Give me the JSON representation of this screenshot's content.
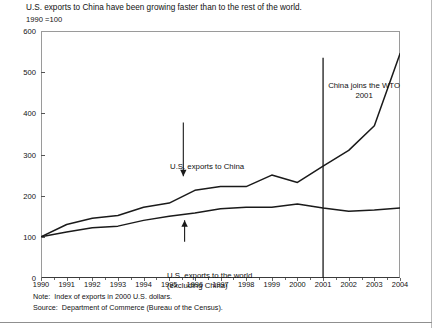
{
  "title": "U.S. exports to China have been growing faster than to the rest of the world.",
  "subtitle": "1990 =100",
  "notes": {
    "note_label": "Note:",
    "note_text": "Index of exports in 2000 U.S. dollars.",
    "source_label": "Source:",
    "source_text": "Department of Commerce (Bureau of the Census)."
  },
  "annotations": {
    "china_series": "U.S. exports to China",
    "world_series_line1": "U.S. exports to the world",
    "world_series_line2": "(excluding China)",
    "wto_line1": "China joins the WTO",
    "wto_line2": "2001"
  },
  "colors": {
    "line": "#1a1a1a",
    "frame": "#9a9a9a",
    "axis": "#3a3a3a",
    "background": "#ffffff"
  },
  "chart_data": {
    "type": "line",
    "title": "U.S. exports to China have been growing faster than to the rest of the world.",
    "subtitle": "1990 =100",
    "xlabel": "",
    "ylabel": "",
    "ylim": [
      0,
      600
    ],
    "ytick_values": [
      0,
      100,
      200,
      300,
      400,
      500,
      600
    ],
    "ytick_labels": [
      "0",
      "100",
      "200",
      "300",
      "400",
      "500",
      "600"
    ],
    "grid": false,
    "legend": "none (inline annotations with arrows)",
    "x": [
      1990,
      1991,
      1992,
      1993,
      1994,
      1995,
      1996,
      1997,
      1998,
      1999,
      2000,
      2001,
      2002,
      2003,
      2004
    ],
    "xtick_labels": [
      "1990",
      "1991",
      "1992",
      "1993",
      "1994",
      "1995",
      "1996",
      "1997",
      "1998",
      "1999",
      "2000",
      "2001",
      "2002",
      "2003",
      "2004"
    ],
    "series": [
      {
        "name": "U.S. exports to China",
        "values": [
          100,
          130,
          145,
          152,
          172,
          182,
          213,
          222,
          222,
          250,
          232,
          272,
          310,
          370,
          545
        ]
      },
      {
        "name": "U.S. exports to the world (excluding China)",
        "values": [
          100,
          112,
          122,
          126,
          140,
          150,
          158,
          168,
          172,
          172,
          180,
          170,
          162,
          165,
          170
        ]
      }
    ],
    "annotations": [
      {
        "text": "U.S. exports to China",
        "points_to_series": "U.S. exports to China",
        "arrow": "down"
      },
      {
        "text": "U.S. exports to the world (excluding China)",
        "points_to_series": "U.S. exports to the world (excluding China)",
        "arrow": "up"
      },
      {
        "text": "China joins the WTO 2001",
        "x": 2001,
        "marker": "vertical-line"
      }
    ]
  }
}
